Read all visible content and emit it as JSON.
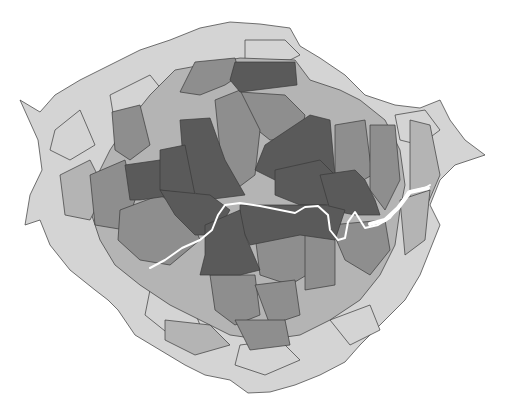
{
  "map": {
    "type": "cartogram",
    "subject": "London boroughs / wards (distorted area cartogram)",
    "color_scale": [
      "#d4d4d4",
      "#b4b4b4",
      "#8e8e8e",
      "#5a5a5a"
    ],
    "border_color": "#3a3a3a",
    "river_color": "#ffffff",
    "background": "#ffffff",
    "labels": []
  }
}
